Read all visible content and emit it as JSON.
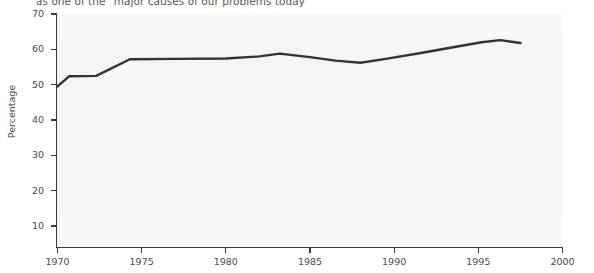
{
  "title": {
    "subtitle": "as one of the \"major causes of our problems today"
  },
  "axes": {
    "ylabel": "Percentage",
    "yticks": [
      10,
      20,
      30,
      40,
      50,
      60,
      70
    ],
    "xticks": [
      1970,
      1975,
      1980,
      1985,
      1990,
      1995,
      2000
    ]
  },
  "colors": {
    "line": "#333333",
    "plot_background": "#f5f5f5",
    "axis": "#3a3a3a",
    "text": "#4a4a4a"
  },
  "chart_data": {
    "type": "line",
    "title": "as one of the \"major causes of our problems today",
    "xlabel": "",
    "ylabel": "Percentage",
    "xlim": [
      1970,
      2000
    ],
    "ylim": [
      0,
      70
    ],
    "grid": false,
    "legend": null,
    "series": [
      {
        "name": "Percentage",
        "x": [
          1970.0,
          1970.7,
          1972.3,
          1974.3,
          1977.0,
          1980.0,
          1982.0,
          1983.2,
          1985.0,
          1986.5,
          1988.0,
          1989.5,
          1991.5,
          1993.5,
          1995.2,
          1996.3,
          1997.5
        ],
        "y": [
          49.5,
          52.4,
          52.5,
          57.2,
          57.3,
          57.4,
          58.0,
          58.8,
          57.8,
          56.8,
          56.2,
          57.3,
          58.9,
          60.6,
          62.0,
          62.6,
          61.8
        ]
      }
    ]
  }
}
